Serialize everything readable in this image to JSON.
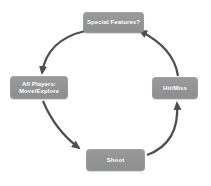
{
  "diagram": {
    "type": "cycle",
    "direction": "counterclockwise",
    "colors": {
      "background": "#ffffff",
      "node_fill": "#929292",
      "node_text": "#ffffff",
      "arrow": "#4e4e4e"
    },
    "nodes": {
      "top": {
        "id": "special-features",
        "label": "Special Features?"
      },
      "left": {
        "id": "all-players-move-explore",
        "label": "All Players: Move/Explore",
        "lines": [
          "All Players:",
          "Move/Explore"
        ]
      },
      "bottom": {
        "id": "shoot",
        "label": "Shoot"
      },
      "right": {
        "id": "hit-miss",
        "label": "Hit/Miss"
      }
    },
    "edges": [
      {
        "from": "special-features",
        "to": "all-players-move-explore"
      },
      {
        "from": "all-players-move-explore",
        "to": "shoot"
      },
      {
        "from": "shoot",
        "to": "hit-miss"
      },
      {
        "from": "hit-miss",
        "to": "special-features"
      }
    ]
  }
}
